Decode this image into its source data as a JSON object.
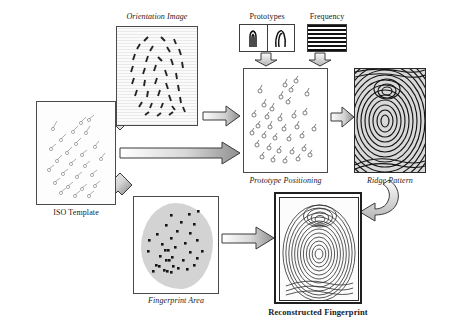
{
  "figure": {
    "type": "diagram",
    "background": "#ffffff"
  },
  "nodes": {
    "iso_template": {
      "label": "ISO Template",
      "label_style": "regular",
      "description": "box of minutiae markers"
    },
    "orientation_image": {
      "label": "Orientation Image",
      "label_style": "italic",
      "description": "textured field with orientation dashes"
    },
    "prototypes": {
      "label": "Prototypes",
      "label_style": "regular",
      "cells": [
        "arch-prototype-glyph",
        "loop-prototype-glyph"
      ]
    },
    "frequency": {
      "label": "Frequency",
      "label_style": "regular",
      "description": "horizontal stripe ridge frequency pattern"
    },
    "prototype_positioning": {
      "label": "Prototype Positioning",
      "label_style": "italic",
      "description": "scattered prototype markers"
    },
    "ridge_pattern": {
      "label": "Ridge Pattern",
      "label_style": "italic",
      "description": "dense synthetic ridge flow image"
    },
    "fingerprint_area": {
      "label": "Fingerprint Area",
      "label_style": "italic",
      "description": "grey elliptical mask with minutiae points"
    },
    "reconstructed_fingerprint": {
      "label": "Reconstructed Fingerprint",
      "label_style": "bold",
      "description": "final rendered fingerprint image in double frame"
    }
  },
  "arrows": [
    {
      "name": "iso-to-orientation",
      "style": "outlined-block",
      "direction": "up-right"
    },
    {
      "name": "iso-to-positioning",
      "style": "gradient-block",
      "direction": "right"
    },
    {
      "name": "iso-to-area",
      "style": "outlined-block",
      "direction": "down-right"
    },
    {
      "name": "orientation-to-positioning",
      "style": "outlined-block",
      "direction": "right"
    },
    {
      "name": "prototypes-to-positioning",
      "style": "outlined-block",
      "direction": "down"
    },
    {
      "name": "frequency-to-positioning",
      "style": "outlined-block",
      "direction": "down"
    },
    {
      "name": "positioning-to-ridge",
      "style": "outlined-block",
      "direction": "right"
    },
    {
      "name": "area-to-reconstructed",
      "style": "gradient-block",
      "direction": "right"
    },
    {
      "name": "ridge-to-reconstructed",
      "style": "curved-block",
      "direction": "down-left"
    }
  ],
  "colors": {
    "ink": "#1a1a1a",
    "box_border": "#4a4a4a",
    "arrow_fill": "#b9b9b9",
    "arrow_stroke": "#3a3a3a",
    "area_blob": "#d3d3d3"
  }
}
